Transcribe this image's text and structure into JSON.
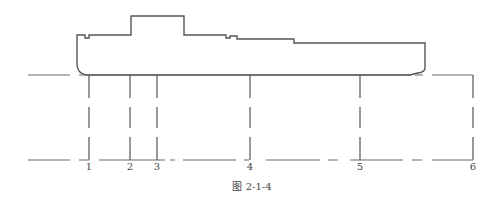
{
  "figure": {
    "caption": "图 2-1-4",
    "stations": [
      {
        "label": "1",
        "x": 89
      },
      {
        "label": "2",
        "x": 130
      },
      {
        "label": "3",
        "x": 157
      },
      {
        "label": "4",
        "x": 250
      },
      {
        "label": "5",
        "x": 360
      },
      {
        "label": "6",
        "x": 473
      }
    ]
  },
  "colors": {
    "line": "#555555",
    "text": "#444444",
    "background": "#ffffff"
  }
}
